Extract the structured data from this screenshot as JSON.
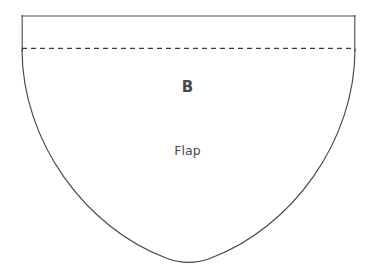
{
  "diagram": {
    "kind": "sewing-pattern-piece",
    "background_color": "#ffffff",
    "outline_color": "#474747",
    "fold_line_color": "#3b3b3b",
    "label_color": "#4a4a4a",
    "outline_width_px": 1,
    "labels": {
      "section": "B",
      "piece_name": "Flap"
    },
    "geometry": {
      "top_edge": {
        "x1": 22,
        "y1": 16,
        "x2": 355,
        "y2": 16
      },
      "left_wall": {
        "x1": 22,
        "y1": 16,
        "x2": 22,
        "y2": 50
      },
      "right_wall": {
        "x1": 355,
        "y1": 16,
        "x2": 355,
        "y2": 50
      },
      "fold_line": {
        "x1": 22,
        "y1": 48,
        "x2": 355,
        "y2": 48,
        "style": "dashed",
        "dash_px": 5,
        "gap_px": 4
      },
      "bowl_curve": {
        "start": {
          "x": 22,
          "y": 50
        },
        "end": {
          "x": 355,
          "y": 50
        },
        "bottom_point": {
          "x": 188,
          "y": 262
        }
      }
    }
  }
}
